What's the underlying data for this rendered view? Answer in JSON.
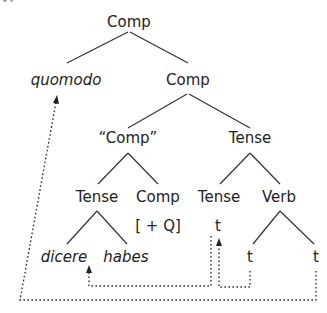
{
  "diagram": {
    "type": "syntax-tree",
    "nodes": {
      "root": {
        "label": "Comp",
        "x": 129,
        "y": 27
      },
      "quomodo": {
        "label": "quomodo",
        "x": 66,
        "y": 85,
        "italic": true
      },
      "comp1": {
        "label": "Comp",
        "x": 188,
        "y": 85
      },
      "quoted_comp": {
        "label": "“Comp”",
        "x": 128,
        "y": 143
      },
      "tense1": {
        "label": "Tense",
        "x": 250,
        "y": 143
      },
      "tense2": {
        "label": "Tense",
        "x": 97,
        "y": 202
      },
      "comp2": {
        "label": "Comp",
        "x": 158,
        "y": 202
      },
      "tense3": {
        "label": "Tense",
        "x": 219,
        "y": 202
      },
      "verb": {
        "label": "Verb",
        "x": 279,
        "y": 202
      },
      "feature_q": {
        "label": "[ + Q]",
        "x": 158,
        "y": 231
      },
      "trace_tense": {
        "label": "t",
        "x": 218,
        "y": 231
      },
      "dicere": {
        "label": "dicere",
        "x": 64,
        "y": 262,
        "italic": true
      },
      "habes": {
        "label": "habes",
        "x": 126,
        "y": 262,
        "italic": true
      },
      "trace_verb1": {
        "label": "t",
        "x": 250,
        "y": 262
      },
      "trace_verb2": {
        "label": "t",
        "x": 316,
        "y": 262
      }
    },
    "movements": [
      {
        "from": "trace_tense",
        "to": "dicere",
        "style": "dotted-arrow"
      },
      {
        "from": "trace_verb1",
        "to": "trace_tense",
        "style": "dotted-arrow"
      },
      {
        "from": "trace_verb2",
        "to": "quomodo",
        "style": "dotted-arrow"
      }
    ]
  }
}
